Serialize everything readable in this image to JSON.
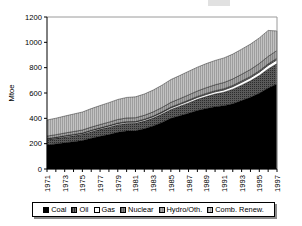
{
  "chart_data": {
    "type": "area",
    "title": "",
    "subtitle": "",
    "xlabel": "",
    "ylabel": "Mtoe",
    "stacked": true,
    "grid": false,
    "legend_position": "bottom",
    "ylim": [
      0,
      1200
    ],
    "ytick_labels": [
      "0",
      "200",
      "400",
      "600",
      "800",
      "1000",
      "1200"
    ],
    "yticks": [
      0,
      200,
      400,
      600,
      800,
      1000,
      1200
    ],
    "x": [
      1971,
      1972,
      1973,
      1974,
      1975,
      1976,
      1977,
      1978,
      1979,
      1980,
      1981,
      1982,
      1983,
      1984,
      1985,
      1986,
      1987,
      1988,
      1989,
      1990,
      1991,
      1992,
      1993,
      1994,
      1995,
      1996,
      1997
    ],
    "xtick_labels": [
      "1971",
      "1973",
      "1975",
      "1977",
      "1979",
      "1981",
      "1983",
      "1985",
      "1987",
      "1989",
      "1991",
      "1993",
      "1995",
      "1997"
    ],
    "series": [
      {
        "name": "Coal",
        "color": "#000000",
        "pattern": "solid",
        "values": [
          190,
          198,
          207,
          216,
          225,
          243,
          258,
          272,
          290,
          300,
          302,
          318,
          340,
          368,
          400,
          420,
          440,
          462,
          478,
          492,
          500,
          516,
          540,
          566,
          598,
          640,
          672
        ]
      },
      {
        "name": "Oil",
        "color": "#4f4f4f",
        "pattern": "dense-dots",
        "values": [
          42,
          44,
          46,
          47,
          49,
          52,
          55,
          58,
          60,
          60,
          59,
          60,
          62,
          66,
          70,
          76,
          82,
          88,
          94,
          100,
          106,
          114,
          122,
          130,
          140,
          150,
          160
        ]
      },
      {
        "name": "Gas",
        "color": "#ffffff",
        "pattern": "none",
        "values": [
          6,
          6,
          7,
          7,
          7,
          8,
          8,
          9,
          9,
          9,
          9,
          10,
          10,
          11,
          12,
          13,
          14,
          15,
          16,
          17,
          18,
          20,
          22,
          24,
          26,
          28,
          30
        ]
      },
      {
        "name": "Nuclear",
        "color": "#6e6e6e",
        "pattern": "fine-hatch",
        "values": [
          2,
          2,
          2,
          3,
          3,
          3,
          4,
          4,
          4,
          5,
          5,
          5,
          6,
          6,
          7,
          7,
          8,
          8,
          9,
          9,
          10,
          10,
          11,
          11,
          12,
          12,
          13
        ]
      },
      {
        "name": "Hydro/Oth.",
        "color": "#9a9a9a",
        "pattern": "vertical-lines",
        "values": [
          20,
          21,
          22,
          23,
          24,
          25,
          26,
          27,
          28,
          29,
          30,
          31,
          33,
          35,
          37,
          39,
          41,
          43,
          45,
          47,
          49,
          51,
          53,
          55,
          57,
          59,
          61
        ]
      },
      {
        "name": "Comb. Renew.",
        "color": "#bdbdbd",
        "pattern": "vertical-lines",
        "values": [
          127,
          130,
          134,
          138,
          142,
          146,
          150,
          154,
          158,
          162,
          165,
          168,
          172,
          176,
          180,
          183,
          186,
          188,
          190,
          192,
          194,
          196,
          198,
          200,
          202,
          205,
          154
        ]
      }
    ],
    "legend_entries": [
      {
        "label": "Coal",
        "swatch": "solid-black"
      },
      {
        "label": "Oil",
        "swatch": "dense-dots"
      },
      {
        "label": "Gas",
        "swatch": "white"
      },
      {
        "label": "Nuclear",
        "swatch": "fine-hatch"
      },
      {
        "label": "Hydro/Oth.",
        "swatch": "light-hatch"
      },
      {
        "label": "Comb. Renew.",
        "swatch": "lighter-hatch"
      }
    ]
  }
}
